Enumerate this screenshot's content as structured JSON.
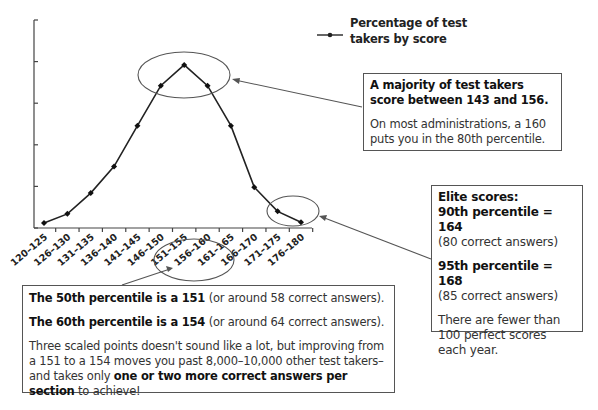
{
  "chart_data": {
    "type": "line",
    "title": "",
    "xlabel": "",
    "ylabel": "",
    "categories": [
      "120–125",
      "126–130",
      "131–135",
      "136–140",
      "141–145",
      "146–150",
      "151–155",
      "156–160",
      "161–165",
      "166–170",
      "171–175",
      "176–180"
    ],
    "series": [
      {
        "name": "Percentage of test takers by score",
        "values": [
          0.6,
          1.7,
          4.2,
          7.4,
          12.3,
          17.1,
          19.6,
          17.1,
          12.3,
          4.9,
          2.0,
          0.7
        ]
      }
    ],
    "ylim": [
      0,
      25
    ],
    "y_ticks_labeled": false,
    "grid": false,
    "legend_position": "top-right",
    "annotations": [
      "Ellipse around peak (146–160)",
      "Ellipse around top scores (171–180)",
      "Ellipse around x labels 151–165"
    ]
  },
  "legend": {
    "line1": "Percentage of test",
    "line2": "takers by score"
  },
  "callouts": {
    "majority": {
      "bold": "A majority of test takers score between 143 and 156.",
      "text": "On most administrations, a 160 puts you in the 80th percentile."
    },
    "elite": {
      "title": "Elite scores:",
      "p90_bold": "90th percentile = 164",
      "p90_note": "(80 correct answers)",
      "p95_bold": "95th percentile = 168",
      "p95_note": "(85 correct answers)",
      "perfect": "There are fewer than 100 perfect scores each year."
    },
    "percentile": {
      "p50_bold": "The 50th percentile is a 151",
      "p50_note": " (or around 58 correct answers).",
      "p60_bold": "The 60th percentile is a 154",
      "p60_note": " (or around 64 correct answers).",
      "body_pre": "Three scaled points doesn't sound like a lot, but improving from a 151 to a 154 moves you past 8,000–10,000 other test takers–and takes only ",
      "body_bold": "one or two more correct answers per section",
      "body_post": " to achieve!"
    }
  }
}
